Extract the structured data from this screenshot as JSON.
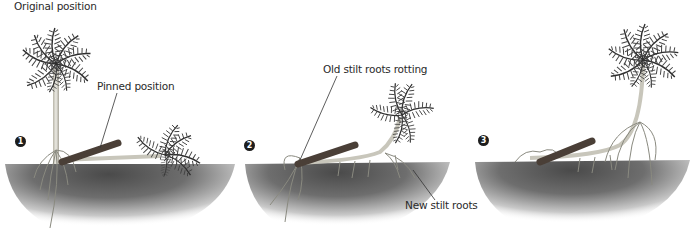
{
  "diagram": {
    "panels": [
      {
        "step": "1",
        "labels": [
          "Original position",
          "Pinned position"
        ]
      },
      {
        "step": "2",
        "labels": [
          "Old stilt roots rotting",
          "New stilt roots"
        ]
      },
      {
        "step": "3",
        "labels": []
      }
    ],
    "colors": {
      "soil_dark": "#5a5a5a",
      "soil_light": "#f2f2f2",
      "leaf": "#3d3d3d",
      "trunk": "#d8d6cc",
      "log": "#4a3f37",
      "text": "#2a2a2a"
    }
  },
  "labels": {
    "original_position": "Original position",
    "pinned_position": "Pinned position",
    "old_stilt_roots": "Old stilt roots rotting",
    "new_stilt_roots": "New stilt roots",
    "step1": "1",
    "step2": "2",
    "step3": "3"
  }
}
